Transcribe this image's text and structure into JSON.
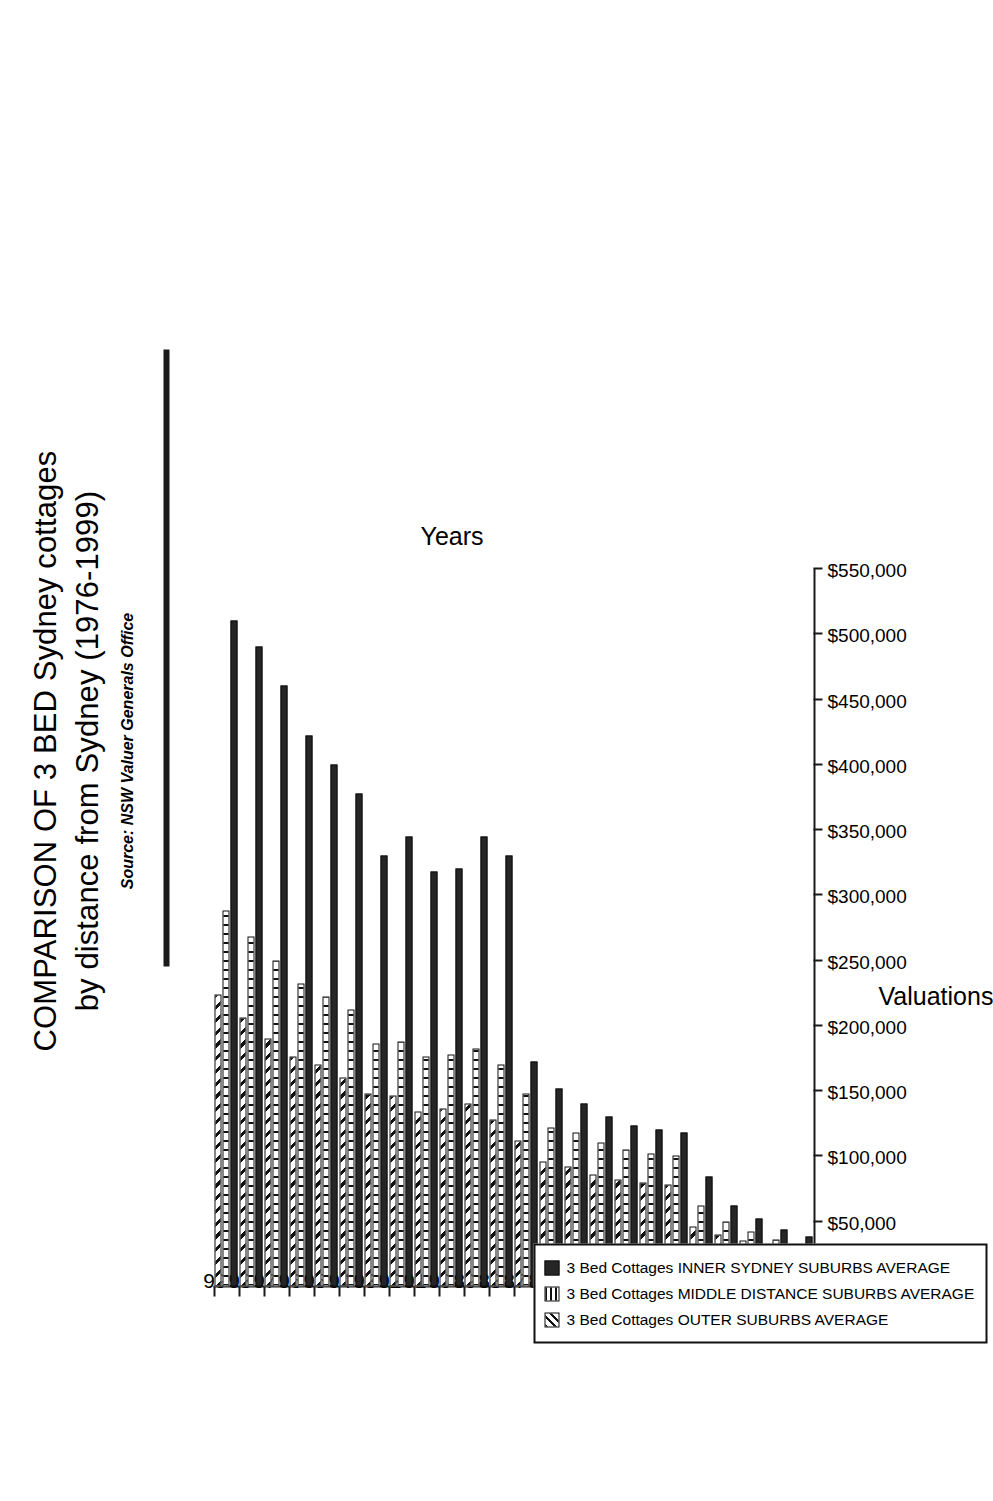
{
  "title": {
    "line1": "COMPARISON OF 3 BED Sydney cottages",
    "line2": "by distance from Sydney (1976-1999)"
  },
  "subtitle": "Source: NSW Valuer Generals Office",
  "axes": {
    "category_axis_label": "Years",
    "value_axis_label": "Valuations"
  },
  "legend": {
    "items": [
      {
        "swatch": "solid-black",
        "label": "3 Bed Cottages INNER SYDNEY SUBURBS AVERAGE"
      },
      {
        "swatch": "vertical-lines",
        "label": "3 Bed Cottages MIDDLE DISTANCE SUBURBS AVERAGE"
      },
      {
        "swatch": "diagonal-hatch",
        "label": "3 Bed Cottages OUTER SUBURBS AVERAGE"
      }
    ]
  },
  "chart_data": {
    "type": "bar",
    "orientation": "horizontal",
    "title": "COMPARISON OF 3 BED Sydney cottages by distance from Sydney (1976-1999)",
    "subtitle": "Source: NSW Valuer Generals Office",
    "xlabel": "Valuations",
    "ylabel": "Years",
    "grid": false,
    "legend_position": "inside-left",
    "value_axis": {
      "min": 0,
      "max": 550000,
      "step": 50000,
      "tick_labels": [
        "$0",
        "$50,000",
        "$100,000",
        "$150,000",
        "$200,000",
        "$250,000",
        "$300,000",
        "$350,000",
        "$400,000",
        "$450,000",
        "$500,000",
        "$550,000"
      ]
    },
    "categories": [
      "76",
      "77",
      "78",
      "79",
      "80",
      "81",
      "82",
      "83",
      "84",
      "85",
      "86",
      "87",
      "88",
      "89",
      "90",
      "91",
      "92",
      "93",
      "94",
      "95",
      "96",
      "97",
      "98",
      "99"
    ],
    "series": [
      {
        "name": "3 Bed Cottages INNER SYDNEY SUBURBS AVERAGE",
        "pattern": "solid-black",
        "values": [
          38000,
          44000,
          52000,
          62000,
          84000,
          118000,
          120000,
          123000,
          130000,
          140000,
          152000,
          172000,
          330000,
          345000,
          320000,
          318000,
          345000,
          330000,
          378000,
          400000,
          422000,
          460000,
          490000,
          510000
        ]
      },
      {
        "name": "3 Bed Cottages MIDDLE DISTANCE SUBURBS AVERAGE",
        "pattern": "vertical-lines",
        "values": [
          30000,
          36000,
          42000,
          50000,
          62000,
          100000,
          102000,
          105000,
          110000,
          118000,
          122000,
          148000,
          170000,
          182000,
          178000,
          176000,
          188000,
          186000,
          212000,
          222000,
          232000,
          250000,
          268000,
          288000
        ]
      },
      {
        "name": "3 Bed Cottages OUTER SUBURBS AVERAGE",
        "pattern": "diagonal-hatch",
        "values": [
          24000,
          29000,
          35000,
          40000,
          46000,
          78000,
          80000,
          82000,
          86000,
          92000,
          96000,
          112000,
          128000,
          140000,
          136000,
          134000,
          146000,
          148000,
          160000,
          170000,
          176000,
          190000,
          206000,
          224000
        ]
      }
    ]
  }
}
